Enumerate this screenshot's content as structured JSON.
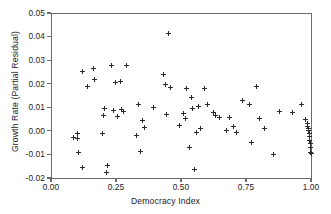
{
  "chart_data": {
    "type": "scatter",
    "title": "",
    "xlabel": "Democracy Index",
    "ylabel": "Growth Rate (Partial Residual)",
    "xlim": [
      0.0,
      1.0
    ],
    "ylim": [
      -0.02,
      0.05
    ],
    "xticks": [
      "0.00",
      "0.25",
      "0.50",
      "0.75",
      "1.00"
    ],
    "xtick_values": [
      0.0,
      0.25,
      0.5,
      0.75,
      1.0
    ],
    "yticks": [
      "0.05",
      "0.04",
      "0.03",
      "0.02",
      "0.01",
      "0.00",
      "-0.01",
      "-0.02"
    ],
    "ytick_values": [
      0.05,
      0.04,
      0.03,
      0.02,
      0.01,
      0.0,
      -0.01,
      -0.02
    ],
    "grid": false,
    "legend": null,
    "marker": "plus",
    "marker_color": "#2a2a2a",
    "series": [
      {
        "name": "Countries",
        "points": [
          [
            0.085,
            -0.003
          ],
          [
            0.1,
            -0.001
          ],
          [
            0.103,
            -0.0034
          ],
          [
            0.107,
            -0.0092
          ],
          [
            0.12,
            0.0252
          ],
          [
            0.123,
            -0.0155
          ],
          [
            0.14,
            0.0189
          ],
          [
            0.163,
            0.0266
          ],
          [
            0.168,
            0.0219
          ],
          [
            0.197,
            -0.001
          ],
          [
            0.2,
            0.0064
          ],
          [
            0.207,
            0.0093
          ],
          [
            0.212,
            -0.0178
          ],
          [
            0.218,
            -0.0145
          ],
          [
            0.232,
            0.0278
          ],
          [
            0.24,
            0.0085
          ],
          [
            0.248,
            0.0207
          ],
          [
            0.255,
            0.0062
          ],
          [
            0.268,
            0.0208
          ],
          [
            0.273,
            0.0089
          ],
          [
            0.28,
            0.0081
          ],
          [
            0.292,
            0.0278
          ],
          [
            0.33,
            -0.002
          ],
          [
            0.338,
            0.011
          ],
          [
            0.343,
            -0.0087
          ],
          [
            0.352,
            0.0043
          ],
          [
            0.36,
            0.0013
          ],
          [
            0.395,
            0.01
          ],
          [
            0.432,
            0.0239
          ],
          [
            0.44,
            0.0197
          ],
          [
            0.446,
            0.0069
          ],
          [
            0.452,
            0.0415
          ],
          [
            0.458,
            0.0185
          ],
          [
            0.495,
            0.0024
          ],
          [
            0.51,
            0.0074
          ],
          [
            0.518,
            0.0052
          ],
          [
            0.522,
            0.018
          ],
          [
            0.532,
            -0.007
          ],
          [
            0.54,
            0.014
          ],
          [
            0.546,
            0.0095
          ],
          [
            0.552,
            -0.0163
          ],
          [
            0.56,
            -0.0006
          ],
          [
            0.568,
            0.0104
          ],
          [
            0.575,
            0.001
          ],
          [
            0.592,
            0.018
          ],
          [
            0.6,
            0.0113
          ],
          [
            0.625,
            0.0077
          ],
          [
            0.632,
            0.0064
          ],
          [
            0.648,
            0.0055
          ],
          [
            0.675,
            0.0003
          ],
          [
            0.686,
            0.0055
          ],
          [
            0.7,
            0.0018
          ],
          [
            0.712,
            -0.0008
          ],
          [
            0.735,
            0.0128
          ],
          [
            0.762,
            0.0112
          ],
          [
            0.772,
            -0.0051
          ],
          [
            0.79,
            0.0189
          ],
          [
            0.8,
            0.0054
          ],
          [
            0.82,
            0.0008
          ],
          [
            0.855,
            -0.0099
          ],
          [
            0.88,
            0.0084
          ],
          [
            0.93,
            0.008
          ],
          [
            0.965,
            0.0112
          ],
          [
            0.98,
            0.005
          ],
          [
            0.985,
            0.0032
          ],
          [
            0.988,
            0.002
          ],
          [
            0.99,
            0.001
          ],
          [
            0.992,
            0.0
          ],
          [
            0.994,
            -0.0012
          ],
          [
            0.995,
            -0.0024
          ],
          [
            0.996,
            -0.004
          ],
          [
            0.997,
            -0.0055
          ],
          [
            0.998,
            -0.0072
          ],
          [
            0.999,
            -0.009
          ],
          [
            1.0,
            -0.0094
          ]
        ]
      }
    ]
  }
}
